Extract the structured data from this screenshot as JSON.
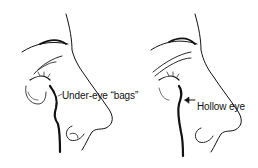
{
  "figure": {
    "panels": [
      {
        "id": "left",
        "subject": "face profile",
        "label": "Under-eye “bags”"
      },
      {
        "id": "right",
        "subject": "face profile",
        "label": "Hollow eye",
        "arrow": "left-arrow"
      }
    ],
    "colors": {
      "line": "#111111",
      "background": "#ffffff"
    }
  }
}
